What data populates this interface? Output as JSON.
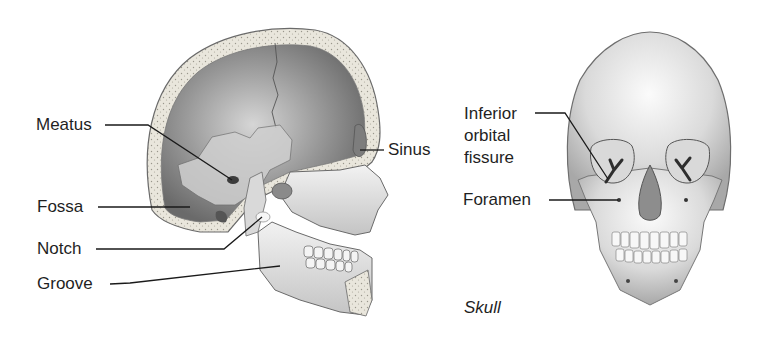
{
  "figure": {
    "lateral_view": {
      "labels": [
        {
          "id": "meatus",
          "text": "Meatus"
        },
        {
          "id": "fossa",
          "text": "Fossa"
        },
        {
          "id": "notch",
          "text": "Notch"
        },
        {
          "id": "groove",
          "text": "Groove"
        },
        {
          "id": "sinus",
          "text": "Sinus"
        }
      ]
    },
    "anterior_view": {
      "labels": [
        {
          "id": "inferior-orbital-fissure",
          "text": "Inferior orbital fissure"
        },
        {
          "id": "foramen",
          "text": "Foramen"
        }
      ],
      "caption": "Skull"
    },
    "colors": {
      "label_text": "#1f1f1f",
      "leader_line": "#1a1a1a",
      "bone_light": "#ececec",
      "bone_mid": "#bdbdbd",
      "bone_dark": "#6e6e6e",
      "cavity_dark": "#4a4a4a"
    }
  }
}
